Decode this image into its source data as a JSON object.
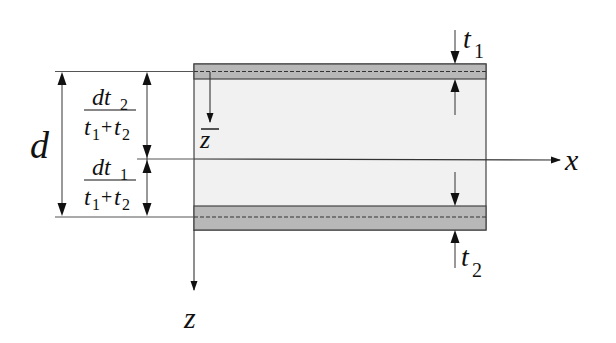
{
  "diagram": {
    "colors": {
      "face_sheet": "#b8b8b8",
      "core": "#f1f1f1",
      "line": "#333333",
      "background": "#ffffff"
    },
    "labels": {
      "d": "d",
      "x_axis": "x",
      "z_axis": "z",
      "z_bar": "z",
      "t1_main": "t",
      "t1_sub": "1",
      "t2_main": "t",
      "t2_sub": "2"
    },
    "fractions": {
      "upper": {
        "num_main": "dt",
        "num_sub": "2",
        "den_a": "t",
        "den_a_sub": "1",
        "den_plus": "+",
        "den_b": "t",
        "den_b_sub": "2"
      },
      "lower": {
        "num_main": "dt",
        "num_sub": "1",
        "den_a": "t",
        "den_a_sub": "1",
        "den_plus": "+",
        "den_b": "t",
        "den_b_sub": "2"
      }
    },
    "components": [
      "top face sheet (thickness t1)",
      "core",
      "bottom face sheet (thickness t2)",
      "neutral axis x",
      "z axis",
      "z-bar local axis"
    ]
  }
}
